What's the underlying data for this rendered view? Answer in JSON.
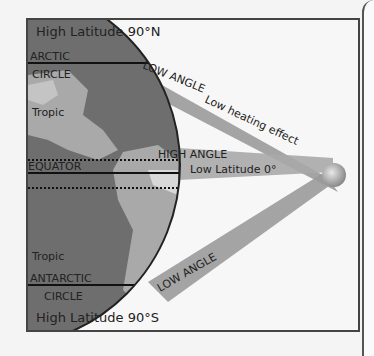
{
  "diagram": {
    "title_top": "High Latitude 90°N",
    "title_bottom": "High Latitude 90°S",
    "labels": {
      "arctic": "ARCTIC",
      "arctic_circle": "CIRCLE",
      "tropic_north": "Tropic",
      "equator": "EQUATOR",
      "tropic_south": "Tropic",
      "antarctic": "ANTARCTIC",
      "antarctic_circle": "CIRCLE",
      "low_angle_top": "LOW ANGLE",
      "low_heating": "Low heating effect",
      "high_angle": "HIGH ANGLE",
      "low_latitude": "Low Latitude 0°",
      "low_angle_bottom": "LOW ANGLE"
    },
    "colors": {
      "globe_ocean": "#6e6e6e",
      "globe_land": "#a9a9a9",
      "ray_band": "#9a9a9a",
      "sun": "#b8b8b8",
      "frame": "#444444",
      "background": "#f7f7f7"
    }
  }
}
